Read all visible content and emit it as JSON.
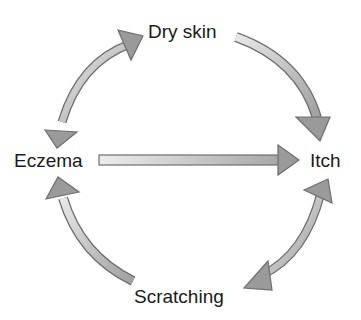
{
  "diagram": {
    "title": "",
    "nodes": {
      "dry_skin": "Dry skin",
      "eczema": "Eczema",
      "itch": "Itch",
      "scratching": "Scratching"
    },
    "edges": [
      {
        "from": "Eczema",
        "to": "Dry skin",
        "type": "bidirectional",
        "shape": "curved"
      },
      {
        "from": "Dry skin",
        "to": "Itch",
        "type": "directed",
        "shape": "curved"
      },
      {
        "from": "Eczema",
        "to": "Itch",
        "type": "directed",
        "shape": "straight"
      },
      {
        "from": "Itch",
        "to": "Scratching",
        "type": "bidirectional",
        "shape": "curved"
      },
      {
        "from": "Scratching",
        "to": "Eczema",
        "type": "directed",
        "shape": "curved"
      }
    ],
    "colors": {
      "arrow_fill_light": "#e4e4e4",
      "arrow_fill_dark": "#9a9a9a",
      "arrow_stroke": "#6e6e6e",
      "text": "#1a1a1a",
      "background": "#ffffff"
    }
  }
}
